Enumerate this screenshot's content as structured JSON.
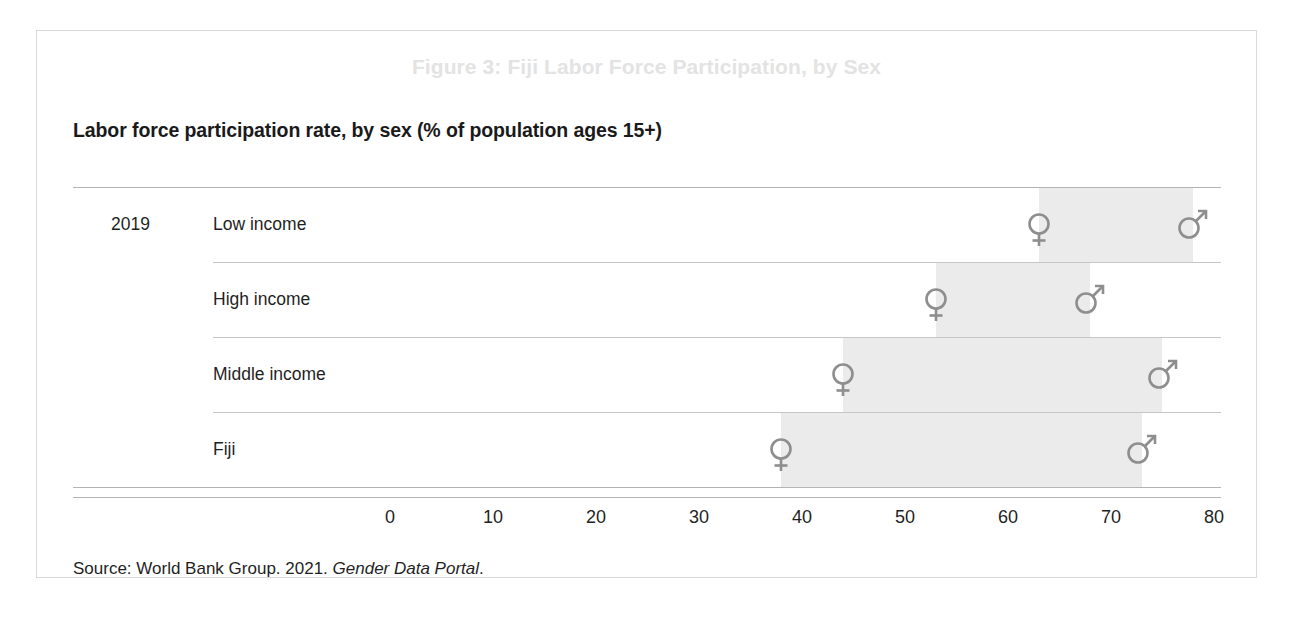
{
  "figure": {
    "title": "Figure 3: Fiji Labor Force Participation, by Sex",
    "subtitle": "Labor force participation rate, by sex (% of population ages 15+)",
    "year_label": "2019",
    "source_prefix": "Source: World Bank Group. 2021.",
    "source_italic": "Gender Data Portal",
    "source_suffix": "."
  },
  "colors": {
    "title": "#e3e3e3",
    "text": "#1f1f1f",
    "marker": "#8e8e8e",
    "band": "#ebebeb",
    "gridline": "#b4b4b4",
    "frame": "#d9d9d9"
  },
  "chart_data": {
    "type": "bar",
    "title": "Labor force participation rate, by sex (% of population ages 15+)",
    "xlabel": "",
    "ylabel": "",
    "xlim": [
      0,
      80
    ],
    "xticks": [
      "0",
      "10",
      "20",
      "30",
      "40",
      "50",
      "60",
      "70",
      "80"
    ],
    "grid": true,
    "legend_position": "none",
    "categories": [
      "Low income",
      "High income",
      "Middle income",
      "Fiji"
    ],
    "series": [
      {
        "name": "Female",
        "symbol": "female-symbol",
        "values": [
          63,
          53,
          44,
          38
        ]
      },
      {
        "name": "Male",
        "symbol": "male-symbol",
        "values": [
          78,
          68,
          75,
          73
        ]
      }
    ],
    "annotations": [
      {
        "text": "2019",
        "target": "Low income"
      }
    ]
  }
}
